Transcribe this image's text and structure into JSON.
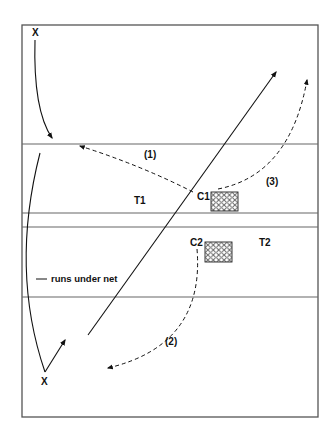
{
  "diagram": {
    "type": "volleyball-drill-diagram",
    "colors": {
      "line": "#555555",
      "ink": "#111111",
      "background": "#ffffff"
    },
    "players": [
      {
        "id": "x-top",
        "label": "X"
      },
      {
        "id": "x-bottom",
        "label": "X"
      }
    ],
    "coaches": [
      {
        "id": "c1",
        "label": "C1"
      },
      {
        "id": "c2",
        "label": "C2"
      }
    ],
    "targets": [
      {
        "id": "t1",
        "label": "T1"
      },
      {
        "id": "t2",
        "label": "T2"
      }
    ],
    "sequence": [
      {
        "id": "seq-1",
        "label": "(1)"
      },
      {
        "id": "seq-2",
        "label": "(2)"
      },
      {
        "id": "seq-3",
        "label": "(3)"
      }
    ],
    "annotation": "runs under net"
  }
}
